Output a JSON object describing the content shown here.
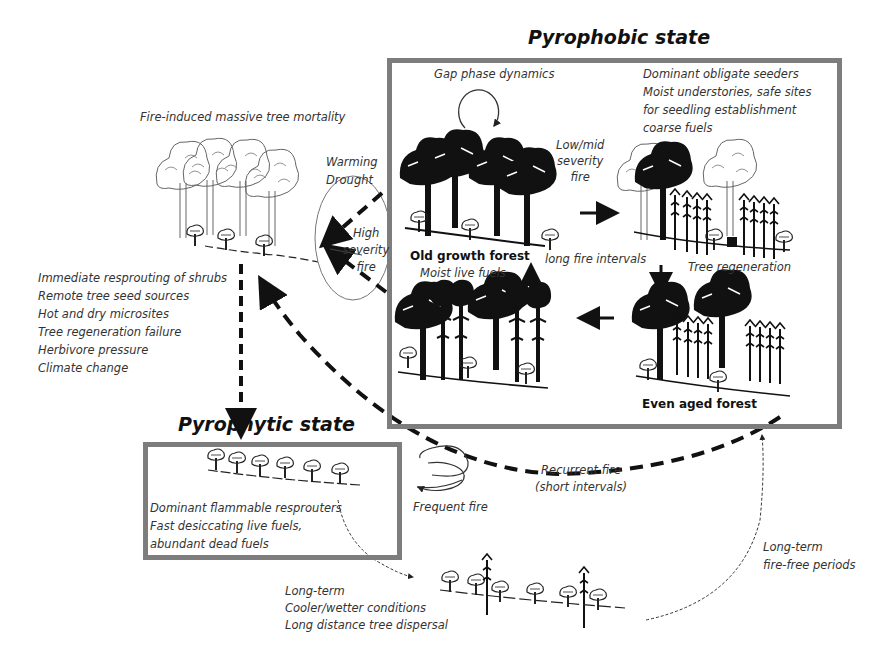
{
  "pyrophobic": {
    "title": "Pyrophobic state",
    "gap_phase": "Gap phase dynamics",
    "seeders_notes": [
      "Dominant obligate seeders",
      "Moist understories, safe sites",
      "for seedling establishment",
      "coarse fuels"
    ],
    "low_mid_fire": [
      "Low/mid",
      "severity",
      "fire"
    ],
    "old_growth_label": "Old growth  forest",
    "moist_live_fuels": "Moist live fuels",
    "long_fire_intervals": "long fire intervals",
    "tree_regeneration": "Tree regeneration",
    "even_aged_label": "Even aged  forest"
  },
  "mortality": {
    "title": "Fire-induced massive tree mortality",
    "drivers": [
      "Warming",
      "Drought"
    ],
    "high_severity": [
      "High",
      "severity",
      "fire"
    ],
    "factors": [
      "Immediate resprouting of shrubs",
      "Remote tree seed sources",
      "Hot and dry microsites",
      "Tree regeneration failure",
      "Herbivore pressure",
      "Climate change"
    ]
  },
  "pyrophytic": {
    "title": "Pyrophytic state",
    "notes": [
      "Dominant flammable resprouters",
      "Fast desiccating  live fuels,",
      "abundant dead fuels"
    ],
    "frequent_fire": "Frequent  fire"
  },
  "recurrent_fire": [
    "Recurrent fire",
    "(short intervals)"
  ],
  "transition": {
    "conditions": [
      "Long-term",
      "Cooler/wetter conditions",
      "Long distance tree dispersal"
    ],
    "fire_free": [
      "Long-term",
      "fire-free periods"
    ]
  },
  "colors": {
    "box_border": "#7d7d7d",
    "ink": "#111111",
    "outline_tree": "#666666"
  }
}
